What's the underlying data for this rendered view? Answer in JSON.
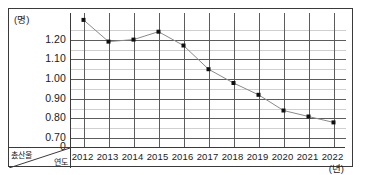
{
  "chart_data": {
    "type": "line",
    "title": "",
    "xlabel": "年度",
    "ylabel": "出産率",
    "x_unit_label": "(년)",
    "y_unit_label": "(명)",
    "categories": [
      "2012",
      "2013",
      "2014",
      "2015",
      "2016",
      "2017",
      "2018",
      "2019",
      "2020",
      "2021",
      "2022"
    ],
    "values": [
      1.3,
      1.19,
      1.2,
      1.24,
      1.17,
      1.05,
      0.98,
      0.92,
      0.84,
      0.81,
      0.78
    ],
    "series": [
      {
        "name": "촜산울",
        "values": [
          1.3,
          1.19,
          1.2,
          1.24,
          1.17,
          1.05,
          0.98,
          0.92,
          0.84,
          0.81,
          0.78
        ]
      }
    ],
    "y_ticks": [
      "1.20",
      "1.10",
      "1.00",
      "0.90",
      "0.80",
      "0.70",
      "0"
    ],
    "y_tick_values": [
      1.2,
      1.1,
      1.0,
      0.9,
      0.8,
      0.7,
      0
    ],
    "ylim": [
      0.655,
      1.335
    ],
    "y_axis_break": true,
    "grid": {
      "horizontal_major": true,
      "horizontal_minor": true,
      "minor_step": 0.05,
      "vertical": true
    },
    "legend": {
      "visible": false
    },
    "marker": "square",
    "line_color": "#8a8a8a",
    "marker_color": "#101010"
  },
  "corner_cell": {
    "row_label": "촜산울",
    "column_label": "연도"
  },
  "axes": {
    "y_unit": "(명)",
    "x_unit": "(년)"
  }
}
